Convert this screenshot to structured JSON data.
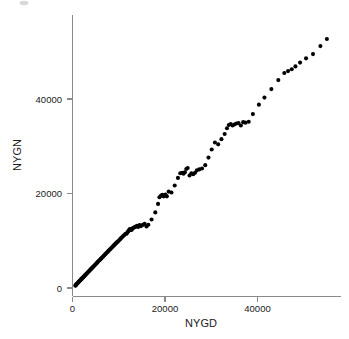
{
  "figure": {
    "width": 349,
    "height": 339,
    "background_color": "#ffffff",
    "axis_color": "#8a8a8a",
    "point_color": "#000000",
    "text_color": "#1a1a1a"
  },
  "chart_data": {
    "type": "scatter",
    "title": "",
    "xlabel": "NYGD",
    "ylabel": "NYGN",
    "xlim": [
      0,
      58000
    ],
    "ylim": [
      0,
      57000
    ],
    "xticks": [
      0,
      20000,
      40000
    ],
    "xtick_labels": [
      "0",
      "20000",
      "40000"
    ],
    "yticks": [
      0,
      20000,
      40000
    ],
    "ytick_labels": [
      "0",
      "20000",
      "40000"
    ],
    "grid": false,
    "legend": "none",
    "marker": "filled-circle",
    "marker_size_px": 3.0,
    "n_points": 140,
    "series": [
      {
        "name": "NYGN vs NYGD",
        "x": [
          620,
          700,
          780,
          860,
          940,
          1020,
          1120,
          1220,
          1320,
          1420,
          1520,
          1630,
          1740,
          1850,
          1960,
          2080,
          2200,
          2320,
          2450,
          2580,
          2700,
          2830,
          2960,
          3090,
          3220,
          3360,
          3500,
          3640,
          3780,
          3920,
          4070,
          4220,
          4370,
          4520,
          4680,
          4840,
          5000,
          5160,
          5320,
          5480,
          5650,
          5820,
          5990,
          6160,
          6340,
          6520,
          6700,
          6880,
          7060,
          7250,
          7440,
          7630,
          7820,
          8010,
          8210,
          8400,
          8600,
          8800,
          9000,
          9200,
          9420,
          9640,
          9860,
          10080,
          10300,
          10520,
          10750,
          10980,
          11200,
          11450,
          11700,
          11900,
          12050,
          12200,
          12350,
          12500,
          12650,
          12800,
          12950,
          13100,
          13300,
          13500,
          13700,
          13950,
          14200,
          14500,
          14800,
          15200,
          15600,
          16000,
          16400,
          17100,
          17900,
          18500,
          18800,
          19100,
          19400,
          19700,
          19900,
          20100,
          20400,
          20800,
          21400,
          22100,
          22800,
          23300,
          23700,
          24000,
          24300,
          24600,
          24900,
          25300,
          25700,
          26100,
          26500,
          26900,
          27400,
          28000,
          28700,
          29400,
          30100,
          30800,
          31500,
          32200,
          32900,
          33400,
          33800,
          34200,
          34600,
          35000,
          35400,
          35900,
          36400,
          36900,
          37400,
          38100,
          39000,
          40300,
          41500,
          43000,
          44500,
          45800,
          46600,
          47400,
          48200,
          49200,
          50500,
          52000,
          53600,
          55000
        ],
        "y": [
          500,
          600,
          700,
          800,
          880,
          960,
          1060,
          1160,
          1270,
          1380,
          1480,
          1590,
          1700,
          1820,
          1930,
          2050,
          2170,
          2300,
          2430,
          2560,
          2680,
          2810,
          2950,
          3080,
          3220,
          3360,
          3500,
          3640,
          3790,
          3940,
          4090,
          4240,
          4400,
          4550,
          4720,
          4880,
          5040,
          5200,
          5370,
          5530,
          5700,
          5870,
          6040,
          6210,
          6390,
          6570,
          6750,
          6940,
          7120,
          7310,
          7500,
          7690,
          7880,
          8070,
          8270,
          8470,
          8670,
          8870,
          9070,
          9280,
          9490,
          9700,
          9910,
          10120,
          10340,
          10560,
          10780,
          11000,
          11230,
          11460,
          11500,
          11800,
          12000,
          12200,
          12400,
          12500,
          12250,
          12350,
          12600,
          12700,
          12800,
          12900,
          13000,
          13150,
          12900,
          13300,
          13100,
          13350,
          13600,
          13000,
          13400,
          14500,
          16000,
          17800,
          19200,
          19500,
          19700,
          19400,
          19600,
          19800,
          19400,
          20400,
          20200,
          21700,
          23300,
          24300,
          24400,
          24200,
          24500,
          25200,
          25400,
          23800,
          24300,
          24100,
          24400,
          24900,
          25100,
          25300,
          26000,
          27600,
          29300,
          30800,
          30400,
          31500,
          32600,
          33800,
          34500,
          34700,
          34400,
          34600,
          34800,
          34900,
          34400,
          35100,
          35000,
          35200,
          36800,
          38800,
          40300,
          42100,
          44000,
          45500,
          45900,
          46300,
          46900,
          47700,
          48600,
          49500,
          51200,
          52700
        ]
      }
    ]
  },
  "axis": {
    "x_label": "NYGD",
    "y_label": "NYGN",
    "x_tick_labels": [
      "0",
      "20000",
      "40000"
    ],
    "y_tick_labels": [
      "0",
      "20000",
      "40000"
    ]
  }
}
